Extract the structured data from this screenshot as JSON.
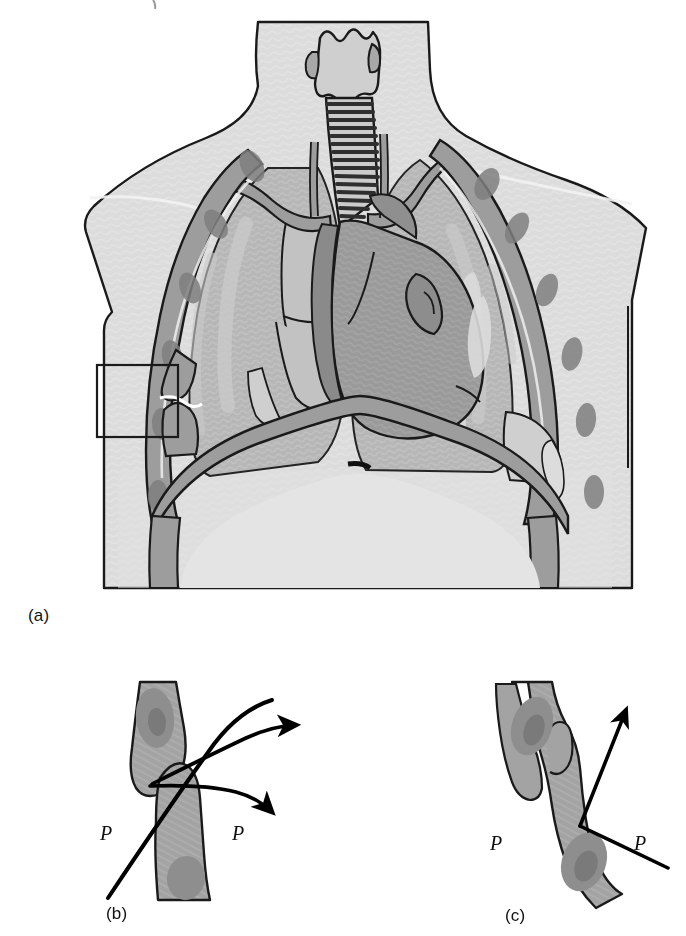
{
  "figure": {
    "type": "medical-illustration",
    "panels": [
      {
        "id": "a",
        "caption": "(a)",
        "description": "Anterior view of the thorax showing larynx, trachea, bronchi, lungs, heart, ribs, clavicles and diaphragm, with a rectangular inset box highlighting a fractured rib on the anatomical right (image left)."
      },
      {
        "id": "b",
        "caption": "(b)",
        "description": "Close-up of a displaced rib fracture: the two fragments are separated and two curved arrows show outward displacement away from the thorax.",
        "force_labels": [
          "P",
          "P"
        ]
      },
      {
        "id": "c",
        "caption": "(c)",
        "description": "Close-up of an overriding rib fracture: the fragments overlap and a straight double-ended arrow indicates the compressive force direction.",
        "force_labels": [
          "P",
          "P"
        ]
      }
    ]
  },
  "labels": {
    "panel_a": "(a)",
    "panel_b": "(b)",
    "panel_c": "(c)",
    "pressure_b_left": "P",
    "pressure_b_right": "P",
    "pressure_c_left": "P",
    "pressure_c_right": "P"
  },
  "colors": {
    "page_background": "#ffffff",
    "body_fill": "#dcdcdc",
    "soft_tissue": "#d2d2d2",
    "lung_fill": "#b5b5b5",
    "lung_highlight": "#c8c8c8",
    "bone_fill": "#a8a8a8",
    "bone_marrow": "#8e8e8e",
    "heart_fill": "#9a9a9a",
    "heart_dark": "#8a8a8a",
    "vessel_fill": "#9d9d9d",
    "trachea_ring": "#3a3a3a",
    "outline": "#1a1a1a",
    "inset_box_stroke": "#1a1a1a",
    "arrow": "#000000"
  }
}
